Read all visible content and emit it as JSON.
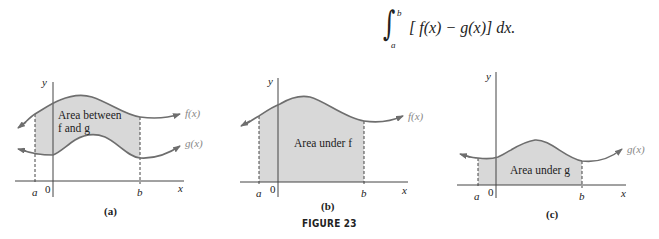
{
  "formula": {
    "upper": "b",
    "lower": "a",
    "integrand": "[ f(x) − g(x)] dx."
  },
  "figure": {
    "caption": "FIGURE 23",
    "colors": {
      "curve": "#6e6e6e",
      "fill": "#d8d8d8",
      "axis": "#444444"
    },
    "panels": [
      {
        "id": "a",
        "sublabel": "(a)",
        "area_label_line1": "Area between",
        "area_label_line2": "f and g",
        "f_label": "f(x)",
        "g_label": "g(x)",
        "axis_x": "x",
        "axis_y": "y",
        "tick_a": "a",
        "tick_0": "0",
        "tick_b": "b"
      },
      {
        "id": "b",
        "sublabel": "(b)",
        "area_label_line1": "Area under f",
        "f_label": "f(x)",
        "axis_x": "x",
        "axis_y": "y",
        "tick_a": "a",
        "tick_0": "0",
        "tick_b": "b"
      },
      {
        "id": "c",
        "sublabel": "(c)",
        "area_label_line1": "Area under g",
        "g_label": "g(x)",
        "axis_x": "x",
        "axis_y": "y",
        "tick_a": "a",
        "tick_0": "0",
        "tick_b": "b"
      }
    ]
  }
}
